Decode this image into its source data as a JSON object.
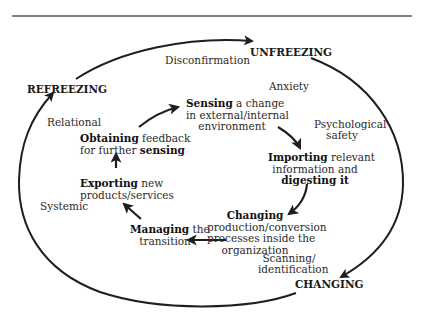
{
  "diagram": {
    "colors": {
      "line": "#1e1e1e",
      "background": "#ffffff"
    },
    "outer_cycle": {
      "stages": [
        {
          "id": "unfreezing",
          "label": "UNFREEZING"
        },
        {
          "id": "changing",
          "label": "CHANGING"
        },
        {
          "id": "refreezing",
          "label": "REFREEZING"
        }
      ],
      "annotations": [
        {
          "id": "disconfirmation",
          "label": "Disconfirmation"
        },
        {
          "id": "anxiety",
          "label": "Anxiety"
        },
        {
          "id": "psychological-safety",
          "lines": [
            "Psychological",
            "safety"
          ]
        },
        {
          "id": "scanning",
          "lines": [
            "Scanning/",
            "identification"
          ]
        },
        {
          "id": "relational",
          "label": "Relational"
        },
        {
          "id": "systemic",
          "label": "Systemic"
        }
      ]
    },
    "inner_cycle": {
      "steps": [
        {
          "id": "sensing",
          "bold": "Sensing",
          "line1_rest": " a change",
          "line2": "in external/internal",
          "line3": "environment"
        },
        {
          "id": "importing",
          "bold": "Importing",
          "line1_rest": " relevant",
          "line2": "information and",
          "line3_bold": "digesting it"
        },
        {
          "id": "changing",
          "bold": "Changing",
          "line2": "production/conversion",
          "line3": "processes inside the",
          "line4": "organization"
        },
        {
          "id": "managing",
          "bold": "Managing",
          "line1_rest": " the",
          "line2": "transition"
        },
        {
          "id": "exporting",
          "bold": "Exporting",
          "line1_rest": " new",
          "line2": "products/services"
        },
        {
          "id": "obtaining",
          "bold": "Obtaining",
          "line1_rest": " feedback",
          "line2_plain": "for further ",
          "line2_bold": "sensing"
        }
      ]
    }
  }
}
